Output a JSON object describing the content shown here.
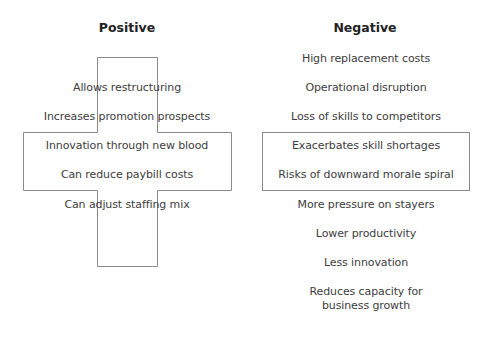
{
  "positive": {
    "heading": "Positive",
    "items": [
      "Allows restructuring",
      "Increases promotion prospects",
      "Innovation through new blood",
      "Can reduce paybill costs",
      "Can adjust staffing mix"
    ]
  },
  "negative": {
    "heading": "Negative",
    "items": [
      "High replacement costs",
      "Operational disruption",
      "Loss of skills to competitors",
      "Exacerbates skill shortages",
      "Risks of downward morale spiral",
      "More pressure on stayers",
      "Lower productivity",
      "Less innovation",
      "Reduces capacity for",
      "business growth"
    ]
  },
  "colors": {
    "outline": "#8a8a8a",
    "text": "#3d3d3d"
  }
}
